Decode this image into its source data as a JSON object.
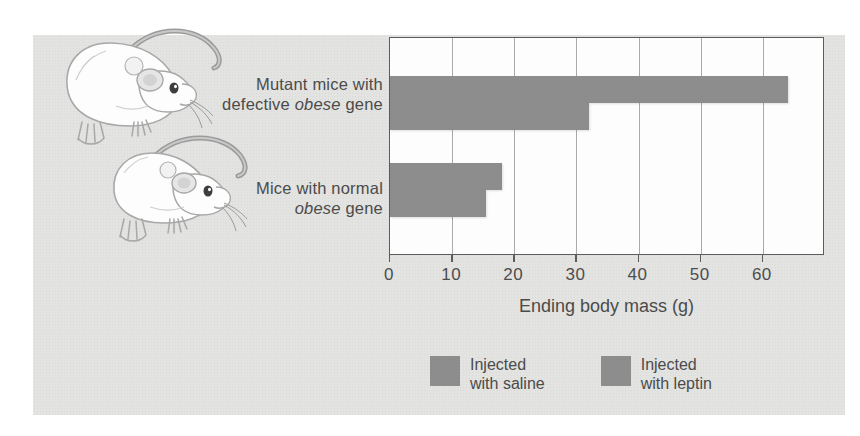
{
  "figure": {
    "background_color": "#e3e3e1",
    "plot_background": "#fdfdfd",
    "bar_color": "#8d8d8d",
    "axis_color": "#5c5c5c",
    "text_color": "#4b4b4b"
  },
  "illustrations": [
    {
      "name": "obese-mouse",
      "caption_group": "Mutant mice with defective obese gene"
    },
    {
      "name": "normal-mouse",
      "caption_group": "Mice with normal obese gene"
    }
  ],
  "categories": [
    {
      "line1": "Mutant mice with",
      "line2_pre": "defective ",
      "line2_em": "obese",
      "line2_post": " gene"
    },
    {
      "line1": "Mice with normal",
      "line2_pre": "",
      "line2_em": "obese",
      "line2_post": " gene"
    }
  ],
  "axis": {
    "title": "Ending body mass (g)",
    "ticks": [
      "0",
      "10",
      "20",
      "30",
      "40",
      "50",
      "60"
    ]
  },
  "legend": [
    {
      "label": "Injected\nwith saline",
      "color": "#8d8d8d"
    },
    {
      "label": "Injected\nwith leptin",
      "color": "#8d8d8d"
    }
  ],
  "chart_data": {
    "type": "bar",
    "orientation": "horizontal",
    "title": "",
    "xlabel": "Ending body mass (g)",
    "ylabel": "",
    "xlim": [
      0,
      70
    ],
    "xticks": [
      0,
      10,
      20,
      30,
      40,
      50,
      60
    ],
    "grid": true,
    "grid_axis": "x",
    "legend_position": "bottom",
    "categories": [
      "Mutant mice with defective obese gene",
      "Mice with normal obese gene"
    ],
    "series": [
      {
        "name": "Injected with saline",
        "values": [
          64,
          18
        ],
        "color": "#8d8d8d"
      },
      {
        "name": "Injected with leptin",
        "values": [
          32,
          15.5
        ],
        "color": "#8d8d8d"
      }
    ]
  }
}
